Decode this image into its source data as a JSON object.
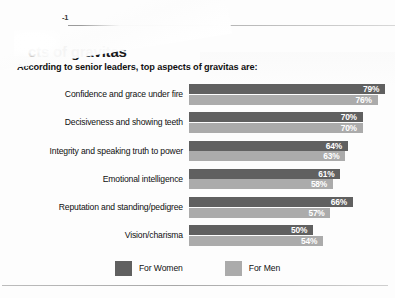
{
  "page": {
    "marker": "-1",
    "background_color": "#fdfdfd"
  },
  "chart_data": {
    "type": "bar",
    "orientation": "horizontal",
    "title": "cts of gravitas",
    "subtitle": "According to senior leaders, top aspects of gravitas are:",
    "xlabel": "",
    "ylabel": "",
    "xlim": [
      0,
      100
    ],
    "grid": false,
    "legend_position": "bottom",
    "value_suffix": "%",
    "categories": [
      "Confidence and grace under fire",
      "Decisiveness and showing teeth",
      "Integrity and speaking truth to power",
      "Emotional intelligence",
      "Reputation and standing/pedigree",
      "Vision/charisma"
    ],
    "series": [
      {
        "name": "For Women",
        "color": "#606060",
        "values": [
          79,
          70,
          64,
          61,
          66,
          50
        ],
        "labels": [
          "79%",
          "70%",
          "64%",
          "61%",
          "66%",
          "50%"
        ]
      },
      {
        "name": "For Men",
        "color": "#ababab",
        "values": [
          76,
          70,
          63,
          58,
          57,
          54
        ],
        "labels": [
          "76%",
          "70%",
          "63%",
          "58%",
          "57%",
          "54%"
        ]
      }
    ]
  }
}
